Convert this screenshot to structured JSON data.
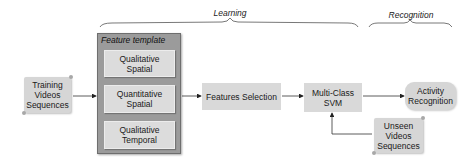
{
  "phases": {
    "learning": "Learning",
    "recognition": "Recognition"
  },
  "template": {
    "title": "Feature template",
    "items": [
      {
        "line1": "Qualitative",
        "line2": "Spatial"
      },
      {
        "line1": "Quantitative",
        "line2": "Spatial"
      },
      {
        "line1": "Qualitative",
        "line2": "Temporal"
      }
    ]
  },
  "nodes": {
    "training": {
      "line1": "Training",
      "line2": "Videos",
      "line3": "Sequences"
    },
    "features_selection": "Features Selection",
    "svm": {
      "line1": "Multi-Class",
      "line2": "SVM"
    },
    "activity": {
      "line1": "Activity",
      "line2": "Recognition"
    },
    "unseen": {
      "line1": "Unseen",
      "line2": "Videos",
      "line3": "Sequences"
    }
  },
  "colors": {
    "box_fill": "#d9d9d9",
    "template_fill": "#9b9b9b",
    "line": "#333333"
  }
}
